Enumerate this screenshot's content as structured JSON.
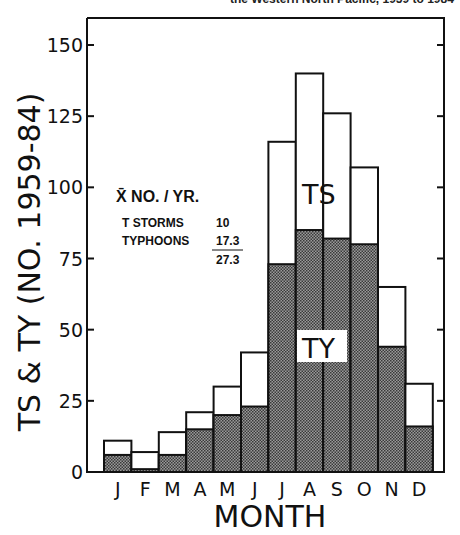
{
  "header": {
    "title_fragment": "the Western North Pacific, 1959 to 1984"
  },
  "legend": {
    "heading": "X̄ NO. / YR.",
    "rows": [
      {
        "label": "T STORMS",
        "value": "10"
      },
      {
        "label": "TYPHOONS",
        "value": "17.3"
      }
    ],
    "total": "27.3"
  },
  "annotations": {
    "ts_label": "TS",
    "ty_label": "TY"
  },
  "chart_data": {
    "type": "bar",
    "subtype": "stacked histogram",
    "title": "the Western North Pacific, 1959 to 1984",
    "xlabel": "MONTH",
    "ylabel": "TS & TY (NO. 1959-84)",
    "categories": [
      "J",
      "F",
      "M",
      "A",
      "M",
      "J",
      "J",
      "A",
      "S",
      "O",
      "N",
      "D"
    ],
    "series": [
      {
        "name": "TY (typhoons)",
        "fill": "stippled gray",
        "values": [
          6,
          1,
          6,
          15,
          20,
          23,
          73,
          85,
          82,
          80,
          44,
          16
        ]
      },
      {
        "name": "TS (tropical storms)",
        "fill": "white",
        "values": [
          5,
          6,
          8,
          6,
          10,
          19,
          43,
          55,
          44,
          27,
          21,
          15
        ]
      }
    ],
    "totals": [
      11,
      7,
      14,
      21,
      30,
      42,
      116,
      140,
      126,
      107,
      65,
      31
    ],
    "yticks": [
      0,
      25,
      50,
      75,
      100,
      125,
      150
    ],
    "ylim": [
      0,
      158
    ],
    "grid": false,
    "legend_position": "upper left (inside plot)",
    "annotations": [
      "TS",
      "TY"
    ],
    "legend_text": {
      "heading": "X̄ NO. / YR.",
      "T STORMS": 10,
      "TYPHOONS": 17.3,
      "total": 27.3
    }
  }
}
